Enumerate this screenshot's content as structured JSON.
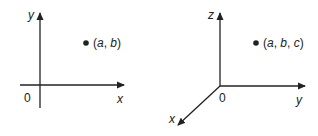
{
  "diagram_2d": {
    "axes": {
      "x_label": "x",
      "y_label": "y",
      "origin_label": "0"
    },
    "point": {
      "label_open": "(",
      "a": "a",
      "sep1": ", ",
      "b": "b",
      "label_close": ")"
    }
  },
  "diagram_3d": {
    "axes": {
      "x_label": "x",
      "y_label": "y",
      "z_label": "z",
      "origin_label": "0"
    },
    "point": {
      "label_open": "(",
      "a": "a",
      "sep1": ", ",
      "b": "b",
      "sep2": ", ",
      "c": "c",
      "label_close": ")"
    }
  },
  "colors": {
    "ink": "#222222",
    "background": "#ffffff"
  }
}
